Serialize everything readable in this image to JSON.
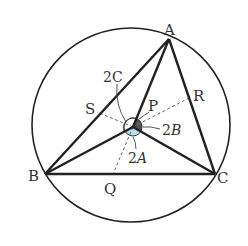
{
  "diagram": {
    "points": {
      "A": "A",
      "B": "B",
      "C": "C",
      "P": "P",
      "Q": "Q",
      "R": "R",
      "S": "S"
    },
    "angle_labels": {
      "angle_BPC": {
        "coef": "2",
        "var": "A"
      },
      "angle_APC": {
        "coef": "2",
        "var": "B"
      },
      "angle_APB": {
        "coef": "2",
        "var": "C"
      }
    },
    "colors": {
      "stroke": "#222222",
      "dashed": "#666666",
      "highlight_2A": "#a8d8ef",
      "shade_2B": "#555555"
    }
  }
}
